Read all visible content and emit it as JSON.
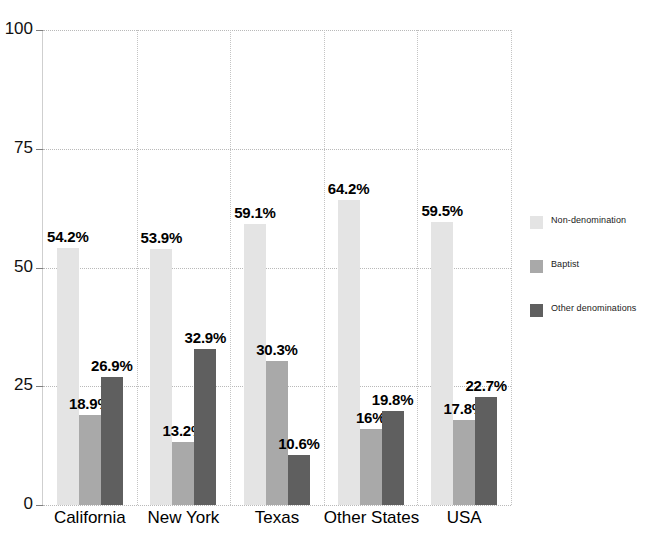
{
  "chart_data": {
    "type": "bar",
    "title": "",
    "subtitle": "",
    "xlabel": "",
    "ylabel": "",
    "categories": [
      "California",
      "New York",
      "Texas",
      "Other States",
      "USA"
    ],
    "series": [
      {
        "name": "Non-denomination",
        "color": "#e4e4e4",
        "values": [
          54.2,
          53.9,
          59.1,
          64.2,
          59.5
        ],
        "labels": [
          "54.2%",
          "53.9%",
          "59.1%",
          "64.2%",
          "59.5%"
        ]
      },
      {
        "name": "Baptist",
        "color": "#a9a9a9",
        "values": [
          18.9,
          13.2,
          30.3,
          16.0,
          17.8
        ],
        "labels": [
          "18.9%",
          "13.2%",
          "30.3%",
          "16%",
          "17.8%"
        ]
      },
      {
        "name": "Other denominations",
        "color": "#5f5f5f",
        "values": [
          26.9,
          32.9,
          10.6,
          19.8,
          22.7
        ],
        "labels": [
          "26.9%",
          "32.9%",
          "10.6%",
          "19.8%",
          "22.7%"
        ]
      }
    ],
    "ylim": [
      0,
      100
    ],
    "yticks": [
      0,
      25,
      50,
      75,
      100
    ],
    "ytick_labels": [
      "0",
      "25",
      "50",
      "75",
      "100"
    ],
    "grid": true,
    "grid_style": "dotted",
    "legend_position": "right"
  },
  "axis": {
    "y_labels": [
      "100",
      "75",
      "50",
      "25",
      "0"
    ]
  },
  "legend": {
    "items": [
      {
        "label": "Non-denomination"
      },
      {
        "label": "Baptist"
      },
      {
        "label": "Other denominations"
      }
    ]
  }
}
